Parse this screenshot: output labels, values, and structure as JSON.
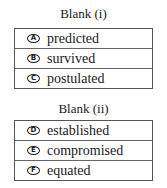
{
  "blanks": [
    {
      "title": "Blank (i)",
      "options": [
        {
          "letter": "A",
          "text": "predicted"
        },
        {
          "letter": "B",
          "text": "survived"
        },
        {
          "letter": "C",
          "text": "postulated"
        }
      ]
    },
    {
      "title": "Blank (ii)",
      "options": [
        {
          "letter": "D",
          "text": "established"
        },
        {
          "letter": "E",
          "text": "compromised"
        },
        {
          "letter": "F",
          "text": "equated"
        }
      ]
    }
  ]
}
